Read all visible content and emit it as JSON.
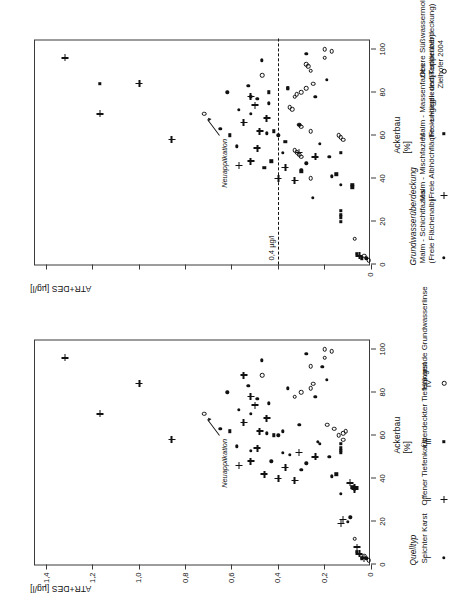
{
  "figure": {
    "credit": "Zielhofer 2004"
  },
  "panel_left": {
    "y_axis_title": "ATR+DES [µg/l]",
    "x_axis_title_line1": "Ackerbau",
    "x_axis_title_line2": "[%]",
    "y_ticks": [
      "0",
      "0,2",
      "0,4",
      "0,6",
      "0,8",
      "1,0",
      "1,2",
      "1,4"
    ],
    "x_ticks": [
      "0",
      "20",
      "40",
      "60",
      "80",
      "100"
    ],
    "annotation": "Neuapplikation",
    "legend": {
      "title": "Quelltyp",
      "items": [
        {
          "roman": "I",
          "symbol": "dot",
          "label_line1": "Seichter Karst",
          "label_line2": ""
        },
        {
          "roman": "II",
          "symbol": "plus",
          "label_line1": "Offener Tiefenkarst",
          "label_line2": ""
        },
        {
          "roman": "III",
          "symbol": "sq",
          "label_line1": "Überdeckter Tiefenkarst",
          "label_line2": ""
        },
        {
          "roman": "IV",
          "symbol": "circ",
          "label_line1": "Hängende Grundwasserlinse",
          "label_line2": ""
        }
      ]
    }
  },
  "panel_right": {
    "y_axis_title": "ATR+DES [µg/l]",
    "x_axis_title_line1": "Ackerbau",
    "x_axis_title_line2": "[%]",
    "y_ticks": [
      "0",
      "",
      "",
      "",
      "",
      "",
      "",
      ""
    ],
    "x_ticks": [
      "0",
      "20",
      "40",
      "60",
      "80",
      "100"
    ],
    "annotation": "Neuapplikation",
    "threshold_label": "0,4 µg/l",
    "threshold_value": 0.4,
    "legend": {
      "title": "Grundwasserüberdeckung",
      "items": [
        {
          "roman": "",
          "symbol": "dot",
          "label_line1": "Malm - Schichtfazies",
          "label_line2": "(Freie Flächenalb)"
        },
        {
          "roman": "",
          "symbol": "plus",
          "label_line1": "Malm - Mischfazies",
          "label_line2": "(Freie Albhöchfläche - ungegliedert)"
        },
        {
          "roman": "",
          "symbol": "sq",
          "label_line1": "Malm - Massenfazies",
          "label_line2": "(Freie Hügel- und Kuppenalb)"
        },
        {
          "roman": "",
          "symbol": "circ",
          "label_line1": "Obere Süßwassermolasse",
          "label_line2": "(Tertiärüberdeckung)"
        }
      ]
    }
  },
  "chart_data": [
    {
      "type": "scatter",
      "title": "Quelltyp",
      "xlabel": "Ackerbau [%]",
      "ylabel": "ATR+DES [µg/l]",
      "xlim": [
        0,
        105
      ],
      "ylim": [
        0,
        1.45
      ],
      "grid": false,
      "legend_position": "right",
      "series": [
        {
          "name": "I Seichter Karst",
          "symbol": "dot",
          "points": [
            [
              3,
              0.02
            ],
            [
              20,
              0.1
            ],
            [
              22,
              0.09
            ],
            [
              33,
              0.13
            ],
            [
              41,
              0.17
            ],
            [
              44,
              0.3
            ],
            [
              47,
              0.28
            ],
            [
              48,
              0.43
            ],
            [
              50,
              0.18
            ],
            [
              51,
              0.35
            ],
            [
              52,
              0.38
            ],
            [
              53,
              0.52
            ],
            [
              55,
              0.58
            ],
            [
              56,
              0.22
            ],
            [
              57,
              0.23
            ],
            [
              60,
              0.4
            ],
            [
              61,
              0.45
            ],
            [
              62,
              0.38
            ],
            [
              63,
              0.65
            ],
            [
              65,
              0.31
            ],
            [
              70,
              0.52
            ],
            [
              72,
              0.57
            ],
            [
              75,
              0.44
            ],
            [
              77,
              0.49
            ],
            [
              78,
              0.24
            ],
            [
              80,
              0.62
            ],
            [
              82,
              0.36
            ],
            [
              83,
              0.53
            ],
            [
              86,
              0.19
            ],
            [
              92,
              0.21
            ],
            [
              95,
              0.47
            ],
            [
              98,
              0.28
            ]
          ]
        },
        {
          "name": "II Offener Tiefenkarst",
          "symbol": "plus",
          "points": [
            [
              3,
              0.03
            ],
            [
              5,
              0.05
            ],
            [
              8,
              0.06
            ],
            [
              19,
              0.13
            ],
            [
              21,
              0.12
            ],
            [
              35,
              0.07
            ],
            [
              36,
              0.07
            ],
            [
              38,
              0.09
            ],
            [
              39,
              0.33
            ],
            [
              40,
              0.4
            ],
            [
              42,
              0.46
            ],
            [
              45,
              0.37
            ],
            [
              46,
              0.57
            ],
            [
              48,
              0.52
            ],
            [
              50,
              0.24
            ],
            [
              52,
              0.31
            ],
            [
              54,
              0.49
            ],
            [
              58,
              0.86
            ],
            [
              62,
              0.48
            ],
            [
              66,
              0.55
            ],
            [
              68,
              0.45
            ],
            [
              70,
              1.17
            ],
            [
              74,
              0.5
            ],
            [
              78,
              0.52
            ],
            [
              84,
              1.0
            ],
            [
              88,
              0.55
            ],
            [
              96,
              1.32
            ]
          ]
        },
        {
          "name": "III Überdeckter Tiefenkarst",
          "symbol": "sq",
          "points": [
            [
              3,
              0.04
            ],
            [
              6,
              0.06
            ],
            [
              36,
              0.08
            ],
            [
              42,
              0.15
            ],
            [
              52,
              0.13
            ],
            [
              53,
              0.13
            ],
            [
              54,
              0.13
            ],
            [
              56,
              0.13
            ],
            [
              60,
              0.42
            ],
            [
              62,
              0.61
            ]
          ]
        },
        {
          "name": "IV Hängende Grundwasserlinse",
          "symbol": "circ",
          "points": [
            [
              2,
              0.01
            ],
            [
              4,
              0.03
            ],
            [
              12,
              0.07
            ],
            [
              58,
              0.12
            ],
            [
              60,
              0.14
            ],
            [
              61,
              0.12
            ],
            [
              62,
              0.11
            ],
            [
              63,
              0.16
            ],
            [
              65,
              0.19
            ],
            [
              70,
              0.72
            ],
            [
              78,
              0.33
            ],
            [
              80,
              0.3
            ],
            [
              82,
              0.26
            ],
            [
              84,
              0.25
            ],
            [
              88,
              0.47
            ],
            [
              92,
              0.26
            ],
            [
              96,
              0.2
            ],
            [
              99,
              0.17
            ],
            [
              100,
              0.2
            ]
          ]
        }
      ],
      "annotations": [
        {
          "text": "Neuapplikation",
          "x": 70,
          "y": 0.72
        }
      ]
    },
    {
      "type": "scatter",
      "title": "Grundwasserüberdeckung",
      "xlabel": "Ackerbau [%]",
      "ylabel": "ATR+DES [µg/l]",
      "xlim": [
        0,
        105
      ],
      "ylim": [
        0,
        1.45
      ],
      "grid": false,
      "legend_position": "right",
      "threshold": {
        "value": 0.4,
        "label": "0,4 µg/l",
        "style": "dashed"
      },
      "series": [
        {
          "name": "Malm - Schichtfazies (Freie Flächenalb)",
          "symbol": "dot",
          "points": [
            [
              3,
              0.02
            ],
            [
              31,
              0.25
            ],
            [
              37,
              0.13
            ],
            [
              41,
              0.17
            ],
            [
              44,
              0.3
            ],
            [
              47,
              0.28
            ],
            [
              50,
              0.18
            ],
            [
              52,
              0.38
            ],
            [
              55,
              0.58
            ],
            [
              56,
              0.22
            ],
            [
              60,
              0.4
            ],
            [
              61,
              0.45
            ],
            [
              63,
              0.65
            ],
            [
              65,
              0.31
            ],
            [
              70,
              0.52
            ],
            [
              72,
              0.57
            ],
            [
              75,
              0.44
            ],
            [
              77,
              0.49
            ],
            [
              78,
              0.24
            ],
            [
              80,
              0.62
            ],
            [
              82,
              0.36
            ],
            [
              83,
              0.53
            ],
            [
              86,
              0.19
            ],
            [
              95,
              0.47
            ],
            [
              98,
              0.28
            ]
          ]
        },
        {
          "name": "Malm - Mischfazies (Freie Albhöchfläche - ungegliedert)",
          "symbol": "plus",
          "points": [
            [
              4,
              0.05
            ],
            [
              39,
              0.33
            ],
            [
              40,
              0.4
            ],
            [
              45,
              0.37
            ],
            [
              46,
              0.57
            ],
            [
              48,
              0.52
            ],
            [
              50,
              0.24
            ],
            [
              52,
              0.31
            ],
            [
              54,
              0.49
            ],
            [
              58,
              0.86
            ],
            [
              62,
              0.48
            ],
            [
              66,
              0.55
            ],
            [
              68,
              0.45
            ],
            [
              70,
              1.17
            ],
            [
              74,
              0.5
            ],
            [
              78,
              0.52
            ],
            [
              84,
              1.0
            ],
            [
              96,
              1.32
            ]
          ]
        },
        {
          "name": "Malm - Massenfazies (Freie Hügel- und Kuppenalb)",
          "symbol": "sq",
          "points": [
            [
              3,
              0.04
            ],
            [
              5,
              0.06
            ],
            [
              20,
              0.13
            ],
            [
              22,
              0.13
            ],
            [
              23,
              0.13
            ],
            [
              25,
              0.13
            ],
            [
              36,
              0.08
            ],
            [
              37,
              0.08
            ],
            [
              42,
              0.15
            ],
            [
              43,
              0.3
            ],
            [
              45,
              0.46
            ],
            [
              48,
              0.43
            ],
            [
              52,
              0.13
            ],
            [
              57,
              0.37
            ],
            [
              60,
              0.61
            ],
            [
              62,
              0.42
            ],
            [
              78,
              0.52
            ],
            [
              80,
              0.44
            ],
            [
              82,
              0.36
            ],
            [
              84,
              1.17
            ]
          ]
        },
        {
          "name": "Obere Süßwassermolasse (Tertiärüberdeckung)",
          "symbol": "circ",
          "points": [
            [
              2,
              0.01
            ],
            [
              4,
              0.03
            ],
            [
              12,
              0.07
            ],
            [
              40,
              0.26
            ],
            [
              50,
              0.3
            ],
            [
              51,
              0.31
            ],
            [
              52,
              0.32
            ],
            [
              53,
              0.33
            ],
            [
              58,
              0.12
            ],
            [
              59,
              0.13
            ],
            [
              60,
              0.14
            ],
            [
              62,
              0.26
            ],
            [
              64,
              0.3
            ],
            [
              65,
              0.31
            ],
            [
              72,
              0.34
            ],
            [
              73,
              0.35
            ],
            [
              78,
              0.33
            ],
            [
              79,
              0.32
            ],
            [
              80,
              0.3
            ],
            [
              82,
              0.28
            ],
            [
              84,
              0.25
            ],
            [
              88,
              0.47
            ],
            [
              90,
              0.26
            ],
            [
              92,
              0.27
            ],
            [
              93,
              0.28
            ],
            [
              96,
              0.2
            ],
            [
              99,
              0.17
            ],
            [
              100,
              0.2
            ],
            [
              70,
              0.72
            ]
          ]
        }
      ],
      "annotations": [
        {
          "text": "Neuapplikation",
          "x": 70,
          "y": 0.72
        }
      ]
    }
  ]
}
